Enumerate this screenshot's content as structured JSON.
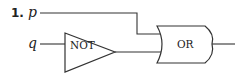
{
  "diagram": {
    "type": "logic-circuit",
    "problem_number": "1.",
    "inputs": [
      {
        "name": "p"
      },
      {
        "name": "q"
      }
    ],
    "gates": [
      {
        "id": "not",
        "label": "NOT",
        "inputs": [
          "q"
        ]
      },
      {
        "id": "or",
        "label": "OR",
        "inputs": [
          "p",
          "not"
        ]
      }
    ],
    "output": "or"
  }
}
